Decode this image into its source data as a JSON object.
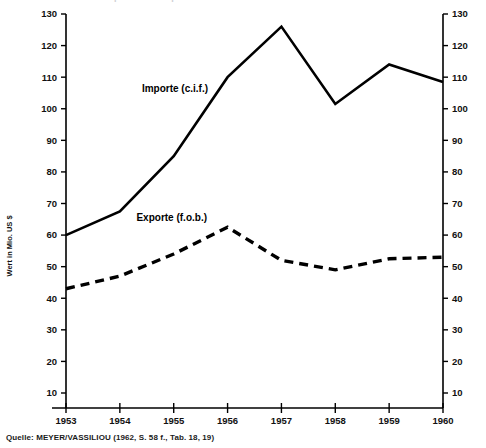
{
  "figure": {
    "title_cut": "Handelsbilanz: Importe und Exporte",
    "source_note": "Quelle: MEYER/VASSILIOU (1962, S. 58 f., Tab. 18, 19)",
    "y_axis_title": "Wert in Mio. US $"
  },
  "chart_data": {
    "type": "line",
    "title": "",
    "xlabel": "",
    "ylabel": "Wert in Mio. US $",
    "x": [
      "1953",
      "1954",
      "1955",
      "1956",
      "1957",
      "1958",
      "1959",
      "1960"
    ],
    "categories": [
      "1953",
      "1954",
      "1955",
      "1956",
      "1957",
      "1958",
      "1959",
      "1960"
    ],
    "ylim": [
      0,
      130
    ],
    "yticks": [
      10,
      20,
      30,
      40,
      50,
      60,
      70,
      80,
      90,
      100,
      110,
      120,
      130
    ],
    "ytick_labels": [
      "10",
      "20",
      "30",
      "40",
      "50",
      "60",
      "70",
      "80",
      "90",
      "100",
      "110",
      "120",
      "130"
    ],
    "xtick_labels": [
      "1953",
      "1954",
      "1955",
      "1956",
      "1957",
      "1958",
      "1959",
      "1960"
    ],
    "grid": false,
    "legend": "inline-annotations",
    "dual_y_axis": true,
    "series": [
      {
        "name": "Importe (c.i.f.)",
        "style": "solid",
        "color": "#000000",
        "values": [
          60,
          67.5,
          85,
          110,
          126,
          101.5,
          114,
          108.5
        ]
      },
      {
        "name": "Exporte (f.o.b.)",
        "style": "dashed",
        "color": "#000000",
        "values": [
          43,
          47,
          54,
          62.5,
          52,
          49,
          52.5,
          53
        ]
      }
    ],
    "annotations": [
      {
        "text": "Importe (c.i.f.)",
        "x": 1955.0,
        "y": 98
      },
      {
        "text": "Exporte (f.o.b.)",
        "x": 1955.0,
        "y": 59
      }
    ]
  },
  "axis_labels": {
    "left": [
      "130",
      "120",
      "110",
      "100",
      "90",
      "80",
      "70",
      "60",
      "50",
      "40",
      "30",
      "20",
      "10"
    ],
    "right": [
      "130",
      "120",
      "110",
      "100",
      "90",
      "80",
      "70",
      "60",
      "50",
      "40",
      "30",
      "20",
      "10"
    ],
    "bottom": [
      "1953",
      "1954",
      "1955",
      "1956",
      "1957",
      "1958",
      "1959",
      "1960"
    ]
  }
}
